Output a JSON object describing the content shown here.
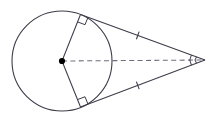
{
  "figure": {
    "type": "geometry-diagram",
    "canvas": {
      "width": 213,
      "height": 120,
      "background": "#ffffff"
    },
    "stroke_color": "#3d3d4a",
    "dash_color": "#6e6e7a",
    "point_color": "#000000",
    "stroke_width": 1.1,
    "circle": {
      "label": "circle",
      "center_x": 62,
      "center_y": 61,
      "radius": 50
    },
    "center_point": {
      "label": "center",
      "x": 62,
      "y": 61,
      "dot_radius": 3.1
    },
    "external_point": {
      "label": "external-point",
      "x": 205,
      "y": 60
    },
    "tangent_points": [
      {
        "label": "upper-tangent-point",
        "x": 80.5,
        "y": 14.5
      },
      {
        "label": "lower-tangent-point",
        "x": 80.5,
        "y": 107.0
      }
    ],
    "radii": [
      {
        "label": "upper-radius",
        "x1": 62,
        "y1": 61,
        "x2": 80.5,
        "y2": 14.5
      },
      {
        "label": "lower-radius",
        "x1": 62,
        "y1": 61,
        "x2": 80.5,
        "y2": 107.0
      }
    ],
    "tangent_segments": [
      {
        "label": "upper-tangent-segment",
        "x1": 80.5,
        "y1": 14.5,
        "x2": 205,
        "y2": 60,
        "tick_count": 1,
        "tick_t": 0.46
      },
      {
        "label": "lower-tangent-segment",
        "x1": 80.5,
        "y1": 107.0,
        "x2": 205,
        "y2": 60,
        "tick_count": 1,
        "tick_t": 0.46
      }
    ],
    "dashed_segment": {
      "label": "center-to-external-point",
      "x1": 62,
      "y1": 61,
      "x2": 205,
      "y2": 60,
      "dash_pattern": "5,3.4"
    },
    "right_angle_markers": [
      {
        "label": "upper-right-angle",
        "x": 80.5,
        "y": 14.5,
        "size": 8
      },
      {
        "label": "lower-right-angle",
        "x": 80.5,
        "y": 107.0,
        "size": 8
      }
    ],
    "angle_marks": [
      {
        "label": "apex-angle-tick-outer",
        "x": 205,
        "y": 60
      },
      {
        "label": "apex-angle-tick-inner",
        "x": 205,
        "y": 60
      }
    ]
  }
}
